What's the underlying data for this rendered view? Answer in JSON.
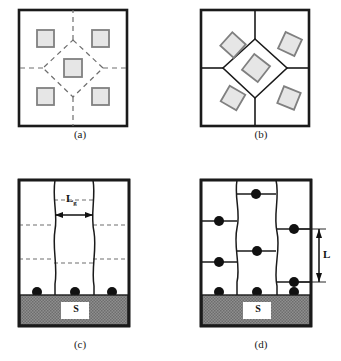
{
  "figure": {
    "type": "microstructure-schematic",
    "panel_count": 4,
    "layout": "2x2",
    "colors": {
      "outline": "#1a1a1a",
      "grain_boundary_dashed": "#6e6e6e",
      "grain_boundary_solid": "#1a1a1a",
      "particle_fill": "#e6e6e6",
      "particle_stroke": "#808080",
      "dot_fill": "#111111",
      "substrate_fill": "#8f8f8f",
      "substrate_label_box": "#ffffff",
      "background": "#ffffff"
    }
  },
  "panels": [
    {
      "id": "a",
      "caption": "(a)",
      "description": "square cell with dashed grain boundaries forming a central diamond and five axis-aligned square particles",
      "boundary_style": "dashed",
      "particle_orientation": "axis-aligned",
      "particle_count": 5,
      "particles": [
        {
          "cx": 37,
          "cy": 37,
          "size": 17,
          "rotate": 0
        },
        {
          "cx": 93,
          "cy": 37,
          "size": 17,
          "rotate": 0
        },
        {
          "cx": 65,
          "cy": 63,
          "size": 17,
          "rotate": 0
        },
        {
          "cx": 37,
          "cy": 90,
          "size": 17,
          "rotate": 0
        },
        {
          "cx": 93,
          "cy": 90,
          "size": 17,
          "rotate": 0
        }
      ]
    },
    {
      "id": "b",
      "caption": "(b)",
      "description": "square cell with solid grain boundaries forming a central diamond and five rotated square particles",
      "boundary_style": "solid",
      "particle_orientation": "rotated",
      "particle_count": 5,
      "particles": [
        {
          "cx": 35,
          "cy": 37,
          "size": 18,
          "rotate": 42
        },
        {
          "cx": 93,
          "cy": 36,
          "size": 18,
          "rotate": 25
        },
        {
          "cx": 64,
          "cy": 62,
          "size": 20,
          "rotate": 38
        },
        {
          "cx": 35,
          "cy": 91,
          "size": 18,
          "rotate": 30
        },
        {
          "cx": 93,
          "cy": 90,
          "size": 18,
          "rotate": 22
        }
      ]
    },
    {
      "id": "c",
      "caption": "(c)",
      "description": "columnar film cross-section on substrate, wavy vertical grain boundaries, dashed horizontal boundaries, dots at film-substrate interface",
      "boundary_style": "dashed-horizontal",
      "dimension_label": "Lg",
      "dimension_label_main": "L",
      "dimension_label_sub": "g",
      "dimension_direction": "horizontal",
      "dot_count": 3,
      "substrate_label": "S"
    },
    {
      "id": "d",
      "caption": "(d)",
      "description": "columnar film cross-section on substrate, wavy vertical grain boundaries, solid horizontal boundaries, dots at every boundary junction",
      "boundary_style": "solid-horizontal",
      "dimension_label": "L",
      "dimension_label_main": "L",
      "dimension_label_sub": "",
      "dimension_direction": "vertical",
      "dot_count": 9,
      "substrate_label": "S"
    }
  ],
  "labels": {
    "caption_a": "(a)",
    "caption_b": "(b)",
    "caption_c": "(c)",
    "caption_d": "(d)",
    "substrate_c": "S",
    "substrate_d": "S",
    "grain_size_c_main": "L",
    "grain_size_c_sub": "g",
    "grain_size_d_main": "L"
  }
}
